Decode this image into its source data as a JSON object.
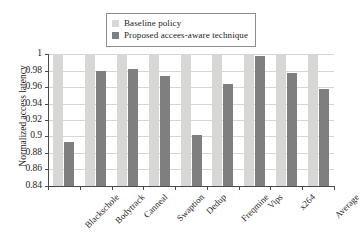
{
  "chart_data": {
    "type": "bar",
    "title": "",
    "subtitle": "",
    "xlabel": "",
    "ylabel": "Normalized access latency",
    "ylim": [
      0.84,
      1
    ],
    "ytick_labels": [
      "0.84",
      "0.86",
      "0.88",
      "0.9",
      "0.92",
      "0.94",
      "0.96",
      "0.98",
      "1"
    ],
    "ytick_values": [
      0.84,
      0.86,
      0.88,
      0.9,
      0.92,
      0.94,
      0.96,
      0.98,
      1
    ],
    "grid": true,
    "legend_position": "top-center",
    "categories": [
      "Blackschole",
      "Bodytrack",
      "Canneal",
      "Swaption",
      "Dedup",
      "Freqmine",
      "Vips",
      "x264",
      "Average"
    ],
    "series": [
      {
        "name": "Baseline policy",
        "color": "#d7d7d5",
        "values": [
          1,
          1,
          1,
          1,
          1,
          1,
          1,
          1,
          1
        ]
      },
      {
        "name": "Proposed accees-aware technique",
        "color": "#7f7f7f",
        "values": [
          0.893,
          0.98,
          0.982,
          0.973,
          0.902,
          0.964,
          0.998,
          0.977,
          0.958
        ]
      }
    ]
  },
  "legend": {
    "items": [
      {
        "label": "Baseline policy",
        "color": "#d7d7d5"
      },
      {
        "label": "Proposed accees-aware technique",
        "color": "#7f7f7f"
      }
    ]
  },
  "axis": {
    "y_title": "Normalized access latency"
  }
}
